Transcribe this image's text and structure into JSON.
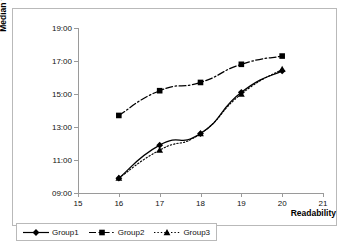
{
  "chart_data": {
    "type": "line",
    "title": "",
    "xlabel": "Readability",
    "ylabel": "Median time (seconds)",
    "x": [
      16,
      17,
      18,
      19,
      20
    ],
    "xlim": [
      15,
      21
    ],
    "ylim": [
      9,
      19
    ],
    "xticks": [
      "15",
      "16",
      "17",
      "18",
      "19",
      "20",
      "21"
    ],
    "yticks": [
      "09:00",
      "11:00",
      "13:00",
      "15:00",
      "17:00",
      "19:00"
    ],
    "ytick_values": [
      9,
      11,
      13,
      15,
      17,
      19
    ],
    "grid": false,
    "legend_position": "bottom-left",
    "series": [
      {
        "name": "Group1",
        "marker": "diamond",
        "linestyle": "solid",
        "color": "#000000",
        "values": [
          9.9,
          11.9,
          12.6,
          15.1,
          16.4
        ]
      },
      {
        "name": "Group2",
        "marker": "square",
        "linestyle": "dash-dot",
        "color": "#000000",
        "values": [
          13.7,
          15.2,
          15.7,
          16.8,
          17.3
        ]
      },
      {
        "name": "Group3",
        "marker": "triangle",
        "linestyle": "dotted",
        "color": "#000000",
        "values": [
          9.9,
          11.6,
          12.6,
          15.0,
          16.5
        ]
      }
    ]
  },
  "axes": {
    "y_title": "Median time (seconds)",
    "x_title": "Readability"
  },
  "legend": {
    "items": [
      {
        "label": "Group1"
      },
      {
        "label": "Group2"
      },
      {
        "label": "Group3"
      }
    ]
  }
}
